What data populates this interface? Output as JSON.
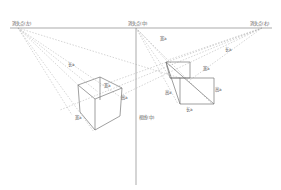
{
  "diagram": {
    "vanishing_points": [
      {
        "id": "left",
        "label": "消失点(左)"
      },
      {
        "id": "center",
        "label": "消失点(中)"
      },
      {
        "id": "right",
        "label": "消失点(右)"
      }
    ],
    "vertical_axis_label": "视线(中)",
    "left_box": {
      "labels": [
        "长a",
        "宽a",
        "高a",
        "宽a"
      ]
    },
    "right_box": {
      "labels": [
        "宽a",
        "长a",
        "宽a",
        "高a",
        "长a",
        "高a"
      ]
    }
  }
}
